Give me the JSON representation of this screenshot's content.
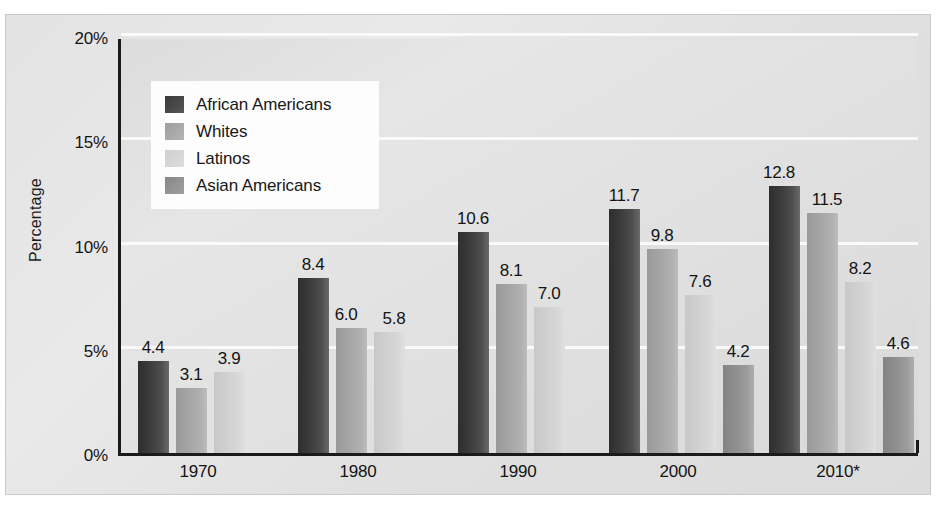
{
  "chart_data": {
    "type": "bar",
    "title": "",
    "xlabel": "",
    "ylabel": "Percentage",
    "ylim": [
      0,
      20
    ],
    "grid": true,
    "legend_position": "upper-left-inside",
    "categories": [
      "1970",
      "1980",
      "1990",
      "2000",
      "2010*"
    ],
    "y_ticks": [
      "0%",
      "5%",
      "10%",
      "15%",
      "20%"
    ],
    "y_tick_values": [
      0,
      5,
      10,
      15,
      20
    ],
    "series": [
      {
        "name": "African Americans",
        "color": "#3a3a3a",
        "values": [
          4.4,
          8.4,
          10.6,
          11.7,
          12.8
        ]
      },
      {
        "name": "Whites",
        "color": "#a8a8a8",
        "values": [
          3.1,
          6.0,
          8.1,
          9.8,
          11.5
        ]
      },
      {
        "name": "Latinos",
        "color": "#d4d4d4",
        "values": [
          3.9,
          5.8,
          7.0,
          7.6,
          8.2
        ]
      },
      {
        "name": "Asian Americans",
        "color": "#919191",
        "values": [
          null,
          null,
          null,
          4.2,
          4.6
        ]
      }
    ],
    "bar_labels": {
      "1970": [
        "4.4",
        "3.1",
        "3.9"
      ],
      "1980": [
        "8.4",
        "6.0",
        "5.8"
      ],
      "1990": [
        "10.6",
        "8.1",
        "7.0"
      ],
      "2000": [
        "11.7",
        "9.8",
        "7.6",
        "4.2"
      ],
      "2010*": [
        "12.8",
        "11.5",
        "8.2",
        "4.6"
      ]
    }
  },
  "axes": {
    "y_title": "Percentage",
    "y_ticks": [
      "20%",
      "15%",
      "10%",
      "5%",
      "0%"
    ],
    "x_ticks": [
      "1970",
      "1980",
      "1990",
      "2000",
      "2010*"
    ]
  },
  "legend": {
    "items": [
      {
        "label": "African Americans",
        "key": "african"
      },
      {
        "label": "Whites",
        "key": "whites"
      },
      {
        "label": "Latinos",
        "key": "latinos"
      },
      {
        "label": "Asian Americans",
        "key": "asian"
      }
    ]
  },
  "colors": {
    "african_americans": "#3a3a3a",
    "whites": "#a8a8a8",
    "latinos": "#d4d4d4",
    "asian_americans": "#919191",
    "panel_background": "#e0e0e0",
    "gridline": "#fbfbfb",
    "axis": "#1a1a1a"
  }
}
